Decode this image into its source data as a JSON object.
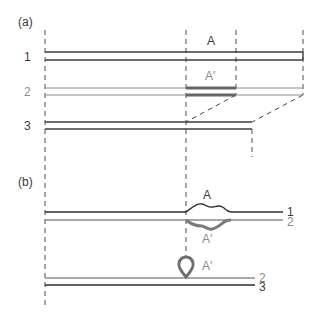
{
  "panels": {
    "a": {
      "label": "(a)",
      "rows": [
        {
          "label": "1"
        },
        {
          "label": "2"
        },
        {
          "label": "3"
        }
      ],
      "segment_labels": {
        "A": "A",
        "A_prime": "A′"
      }
    },
    "b": {
      "label": "(b)",
      "top_pair": {
        "strand1_label": "1",
        "strand2_label": "2",
        "A": "A",
        "A_prime": "A′"
      },
      "bottom_pair": {
        "strand2_label": "2",
        "strand3_label": "3",
        "loop_label": "A′"
      }
    }
  },
  "colors": {
    "dark_strand": "#3c3c3c",
    "gray_strand": "#8c8c8c",
    "highlight": "#6a6a6a",
    "dashed": "#4a4a4a"
  }
}
